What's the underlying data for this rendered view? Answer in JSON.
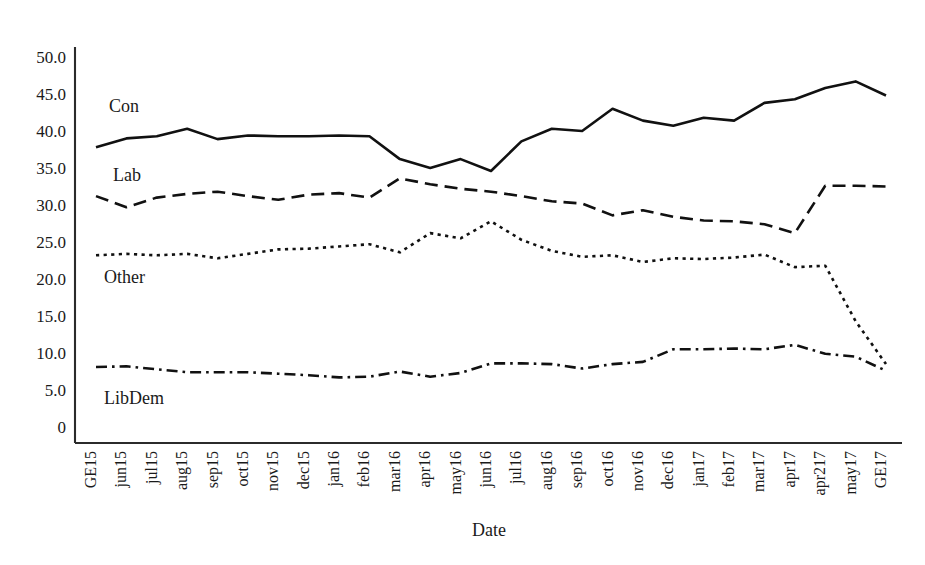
{
  "chart_data": {
    "type": "line",
    "title": "",
    "xlabel": "Date",
    "ylabel": "",
    "ylim": [
      0,
      52
    ],
    "yticks": [
      0,
      5,
      10,
      15,
      20,
      25,
      30,
      35,
      40,
      45,
      50
    ],
    "ytick_labels": [
      "0",
      "5.0",
      "10.0",
      "15.0",
      "20.0",
      "25.0",
      "30.0",
      "35.0",
      "40.0",
      "45.0",
      "50.0"
    ],
    "grid": false,
    "legend_position": "inline-left",
    "categories": [
      "GE15",
      "jun15",
      "jul15",
      "aug15",
      "sep15",
      "oct15",
      "nov15",
      "dec15",
      "jan16",
      "feb16",
      "mar16",
      "apr16",
      "may16",
      "jun16",
      "jul16",
      "aug16",
      "sep16",
      "oct16",
      "nov16",
      "dec16",
      "jan17",
      "feb17",
      "mar17",
      "apr17",
      "apr217",
      "may17",
      "GE17"
    ],
    "series": [
      {
        "name": "Con",
        "line_style": "solid",
        "values": [
          37.8,
          39.0,
          39.3,
          40.3,
          38.9,
          39.4,
          39.3,
          39.3,
          39.4,
          39.3,
          36.2,
          35.0,
          36.2,
          34.6,
          38.6,
          40.3,
          40.0,
          43.0,
          41.4,
          40.7,
          41.8,
          41.4,
          43.8,
          44.3,
          45.8,
          46.7,
          44.8
        ]
      },
      {
        "name": "Lab",
        "line_style": "dashed",
        "values": [
          31.2,
          29.7,
          31.0,
          31.5,
          31.8,
          31.2,
          30.7,
          31.4,
          31.6,
          31.0,
          33.6,
          32.8,
          32.2,
          31.8,
          31.2,
          30.5,
          30.2,
          28.6,
          29.3,
          28.4,
          27.9,
          27.8,
          27.4,
          26.2,
          32.6,
          32.6,
          32.5
        ]
      },
      {
        "name": "Other",
        "line_style": "dotted",
        "values": [
          23.2,
          23.4,
          23.2,
          23.4,
          22.8,
          23.4,
          24.0,
          24.1,
          24.4,
          24.7,
          23.6,
          26.2,
          25.5,
          27.8,
          25.3,
          23.8,
          23.0,
          23.2,
          22.3,
          22.8,
          22.7,
          22.9,
          23.3,
          21.6,
          21.8,
          14.3,
          8.5
        ]
      },
      {
        "name": "LibDem",
        "line_style": "dash-dot",
        "values": [
          8.1,
          8.2,
          7.8,
          7.4,
          7.4,
          7.4,
          7.2,
          7.0,
          6.7,
          6.8,
          7.5,
          6.8,
          7.3,
          8.6,
          8.6,
          8.5,
          7.9,
          8.5,
          8.8,
          10.5,
          10.5,
          10.6,
          10.5,
          11.1,
          9.9,
          9.5,
          7.6
        ]
      }
    ],
    "series_labels": [
      {
        "text": "Con",
        "x": 109,
        "y": 112
      },
      {
        "text": "Lab",
        "x": 113,
        "y": 181
      },
      {
        "text": "Other",
        "x": 104,
        "y": 283
      },
      {
        "text": "LibDem",
        "x": 104,
        "y": 404
      }
    ]
  }
}
